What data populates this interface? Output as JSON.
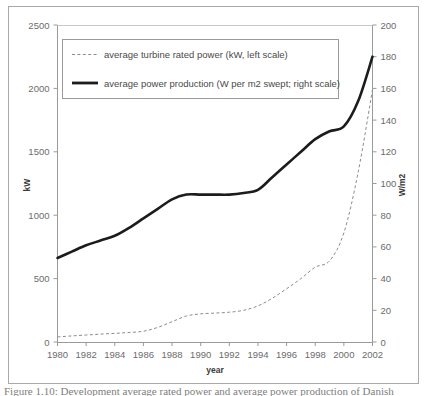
{
  "figure": {
    "caption_sliver": "Figure 1.10: Development average rated power and average power production of Danish"
  },
  "chart_data": {
    "type": "line",
    "title": "",
    "xlabel": "year",
    "ylabel": "kW",
    "y2label": "W/m2",
    "grid": false,
    "legend_position": "top-left-inside",
    "x": [
      1980,
      1981,
      1982,
      1983,
      1984,
      1985,
      1986,
      1987,
      1988,
      1989,
      1990,
      1991,
      1992,
      1993,
      1994,
      1995,
      1996,
      1997,
      1998,
      1999,
      2000,
      2001,
      2002
    ],
    "xlim": [
      1980,
      2002
    ],
    "xticks": [
      1980,
      1982,
      1984,
      1986,
      1988,
      1990,
      1992,
      1994,
      1996,
      1998,
      2000,
      2002
    ],
    "ylim": [
      0,
      2500
    ],
    "yticks": [
      0,
      500,
      1000,
      1500,
      2000,
      2500
    ],
    "y2lim": [
      0,
      200
    ],
    "y2ticks": [
      0,
      20,
      40,
      60,
      80,
      100,
      120,
      140,
      160,
      180,
      200
    ],
    "series": [
      {
        "name": "average turbine rated power (kW, left scale)",
        "axis": "left",
        "unit": "kW",
        "style": "dashed",
        "color": "#8c8c8c",
        "values": [
          40,
          48,
          55,
          62,
          68,
          75,
          85,
          115,
          160,
          205,
          222,
          228,
          235,
          250,
          285,
          345,
          420,
          500,
          590,
          640,
          860,
          1340,
          1990
        ]
      },
      {
        "name": "average power production (W per m2 swept; right scale)",
        "axis": "right",
        "unit": "W/m2",
        "style": "solid",
        "color": "#1c1c1c",
        "values": [
          53,
          57,
          61,
          64,
          67,
          72,
          78,
          84,
          90,
          93,
          93,
          93,
          93,
          94,
          96,
          104,
          112,
          120,
          128,
          133,
          136,
          152,
          180
        ]
      }
    ]
  },
  "legend": {
    "items": [
      {
        "label": "average turbine rated power (kW, left scale)",
        "style": "dashed"
      },
      {
        "label": "average power production (W per m2 swept; right scale)",
        "style": "solid"
      }
    ]
  },
  "axes": {
    "left": {
      "title": "kW",
      "ticks": [
        "0",
        "500",
        "1000",
        "1500",
        "2000",
        "2500"
      ]
    },
    "right": {
      "title": "W/m2",
      "ticks": [
        "0",
        "20",
        "40",
        "60",
        "80",
        "100",
        "120",
        "140",
        "160",
        "180",
        "200"
      ]
    },
    "bottom": {
      "title": "year",
      "ticks": [
        "1980",
        "1982",
        "1984",
        "1986",
        "1988",
        "1990",
        "1992",
        "1994",
        "1996",
        "1998",
        "2000",
        "2002"
      ]
    }
  },
  "colors": {
    "frame": "#a8a8a8",
    "axis": "#9a9a9a",
    "tick_text": "#6b6b6b",
    "series_solid": "#1c1c1c",
    "series_dashed": "#8c8c8c",
    "background": "#ffffff"
  }
}
